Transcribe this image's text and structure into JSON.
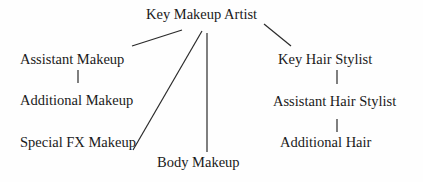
{
  "diagram": {
    "type": "org-chart",
    "nodes": {
      "key_makeup_artist": "Key Makeup Artist",
      "assistant_makeup": "Assistant Makeup",
      "additional_makeup": "Additional Makeup",
      "special_fx_makeup": "Special FX Makeup",
      "body_makeup": "Body Makeup",
      "key_hair_stylist": "Key Hair Stylist",
      "assistant_hair_stylist": "Assistant Hair Stylist",
      "additional_hair": "Additional Hair"
    },
    "edges": [
      [
        "Key Makeup Artist",
        "Assistant Makeup"
      ],
      [
        "Key Makeup Artist",
        "Special FX Makeup"
      ],
      [
        "Key Makeup Artist",
        "Body Makeup"
      ],
      [
        "Key Makeup Artist",
        "Key Hair Stylist"
      ],
      [
        "Assistant Makeup",
        "Additional Makeup"
      ],
      [
        "Key Hair Stylist",
        "Assistant Hair Stylist"
      ],
      [
        "Assistant Hair Stylist",
        "Additional Hair"
      ]
    ]
  }
}
